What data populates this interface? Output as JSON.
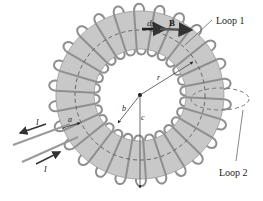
{
  "diagram": {
    "labels": {
      "loop1": "Loop 1",
      "loop2": "Loop 2",
      "ds": "ds",
      "B": "B",
      "r": "r",
      "a": "a",
      "b": "b",
      "c": "c",
      "current_out": "I",
      "current_in": "I"
    },
    "colors": {
      "ring_fill": "#c8c8c8",
      "ring_stroke": "#8a8a8a",
      "wire": "#8f8f8f",
      "arrow": "#3a3a3a",
      "text": "#222222"
    },
    "geometry": {
      "center": [
        140,
        95
      ],
      "outer_radius": 84,
      "inner_radius": 46,
      "loop1_radius": 65,
      "turns": 26
    }
  }
}
